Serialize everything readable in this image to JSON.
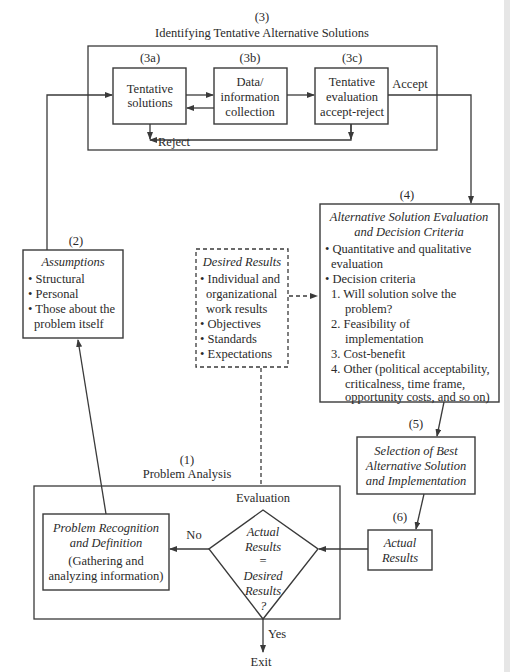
{
  "section3": {
    "number": "(3)",
    "title": "Identifying Tentative Alternative Solutions",
    "sub_a": {
      "number": "(3a)",
      "lines": [
        "Tentative",
        "solutions"
      ]
    },
    "sub_b": {
      "number": "(3b)",
      "lines": [
        "Data/",
        "information",
        "collection"
      ]
    },
    "sub_c": {
      "number": "(3c)",
      "lines": [
        "Tentative",
        "evaluation",
        "accept-reject"
      ]
    },
    "reject_label": "Reject",
    "accept_label": "Accept"
  },
  "section2": {
    "number": "(2)",
    "title": "Assumptions",
    "bullets": [
      "• Structural",
      "• Personal",
      "• Those about the",
      "problem itself"
    ]
  },
  "desired": {
    "title": "Desired Results",
    "lines": [
      "• Individual and",
      "organizational",
      "work results",
      "• Objectives",
      "• Standards",
      "• Expectations"
    ]
  },
  "section4": {
    "number": "(4)",
    "title_lines": [
      "Alternative Solution Evaluation",
      "and Decision Criteria"
    ],
    "lines": [
      "• Quantitative and qualitative",
      "evaluation",
      "• Decision criteria",
      "1. Will solution solve the",
      "problem?",
      "2. Feasibility of",
      "implementation",
      "3. Cost-benefit",
      "4. Other (political acceptability,",
      "criticalness, time frame,",
      "opportunity costs, and so on)"
    ]
  },
  "section5": {
    "number": "(5)",
    "lines": [
      "Selection of Best",
      "Alternative Solution",
      "and Implementation"
    ]
  },
  "section6": {
    "number": "(6)",
    "lines": [
      "Actual",
      "Results"
    ]
  },
  "section1": {
    "number": "(1)",
    "title": "Problem Analysis",
    "evaluation_label": "Evaluation",
    "recognition_title": [
      "Problem Recognition",
      "and Definition"
    ],
    "recognition_body": [
      "(Gathering and",
      "analyzing information)"
    ],
    "diamond": [
      "Actual",
      "Results",
      "=",
      "Desired",
      "Results",
      "?"
    ],
    "no_label": "No",
    "yes_label": "Yes",
    "exit_label": "Exit"
  }
}
